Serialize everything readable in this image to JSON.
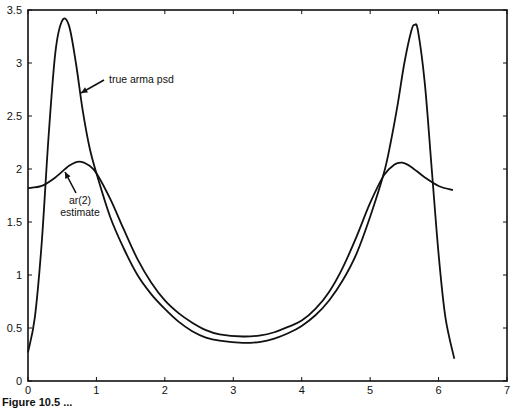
{
  "chart_data": {
    "type": "line",
    "title": "",
    "xlabel": "",
    "ylabel": "",
    "xlim": [
      0,
      7
    ],
    "ylim": [
      0,
      3.5
    ],
    "grid": false,
    "legend": "none (inline annotations with arrows)",
    "x_ticks": [
      "0",
      "1",
      "2",
      "3",
      "4",
      "5",
      "6",
      "7"
    ],
    "y_ticks": [
      "0",
      "0.5",
      "1",
      "1.5",
      "2",
      "2.5",
      "3",
      "3.5"
    ],
    "series": [
      {
        "name": "true arma psd",
        "points": [
          [
            0,
            0.27
          ],
          [
            0.1,
            0.6
          ],
          [
            0.2,
            1.3
          ],
          [
            0.3,
            2.3
          ],
          [
            0.4,
            3.1
          ],
          [
            0.5,
            3.4
          ],
          [
            0.6,
            3.35
          ],
          [
            0.7,
            3.0
          ],
          [
            0.8,
            2.55
          ],
          [
            0.9,
            2.2
          ],
          [
            1.0,
            1.96
          ],
          [
            1.2,
            1.55
          ],
          [
            1.4,
            1.25
          ],
          [
            1.6,
            1.0
          ],
          [
            1.8,
            0.82
          ],
          [
            2.0,
            0.68
          ],
          [
            2.2,
            0.56
          ],
          [
            2.4,
            0.47
          ],
          [
            2.6,
            0.41
          ],
          [
            2.8,
            0.38
          ],
          [
            3.14,
            0.36
          ],
          [
            3.4,
            0.37
          ],
          [
            3.6,
            0.4
          ],
          [
            3.8,
            0.45
          ],
          [
            4.0,
            0.52
          ],
          [
            4.2,
            0.62
          ],
          [
            4.4,
            0.76
          ],
          [
            4.6,
            0.95
          ],
          [
            4.8,
            1.2
          ],
          [
            5.0,
            1.55
          ],
          [
            5.2,
            1.96
          ],
          [
            5.3,
            2.25
          ],
          [
            5.4,
            2.6
          ],
          [
            5.5,
            3.0
          ],
          [
            5.6,
            3.3
          ],
          [
            5.65,
            3.36
          ],
          [
            5.7,
            3.3
          ],
          [
            5.8,
            2.8
          ],
          [
            5.9,
            2.0
          ],
          [
            6.0,
            1.2
          ],
          [
            6.1,
            0.6
          ],
          [
            6.23,
            0.21
          ]
        ]
      },
      {
        "name": "ar(2) estimate",
        "points": [
          [
            0,
            1.82
          ],
          [
            0.2,
            1.84
          ],
          [
            0.4,
            1.92
          ],
          [
            0.6,
            2.03
          ],
          [
            0.75,
            2.07
          ],
          [
            0.9,
            2.03
          ],
          [
            1.0,
            1.96
          ],
          [
            1.2,
            1.72
          ],
          [
            1.4,
            1.43
          ],
          [
            1.6,
            1.15
          ],
          [
            1.8,
            0.93
          ],
          [
            2.0,
            0.76
          ],
          [
            2.2,
            0.64
          ],
          [
            2.4,
            0.55
          ],
          [
            2.6,
            0.48
          ],
          [
            2.8,
            0.44
          ],
          [
            3.14,
            0.42
          ],
          [
            3.4,
            0.43
          ],
          [
            3.6,
            0.46
          ],
          [
            3.8,
            0.51
          ],
          [
            4.0,
            0.57
          ],
          [
            4.2,
            0.68
          ],
          [
            4.4,
            0.84
          ],
          [
            4.6,
            1.07
          ],
          [
            4.8,
            1.36
          ],
          [
            5.0,
            1.68
          ],
          [
            5.2,
            1.94
          ],
          [
            5.35,
            2.04
          ],
          [
            5.47,
            2.06
          ],
          [
            5.6,
            2.02
          ],
          [
            5.8,
            1.92
          ],
          [
            6.0,
            1.84
          ],
          [
            6.21,
            1.8
          ]
        ]
      }
    ],
    "annotations": [
      {
        "text": "true arma psd",
        "label_x": 109,
        "label_y": 83,
        "arrow_from": [
          104,
          80
        ],
        "arrow_to": [
          81,
          93
        ]
      },
      {
        "text_lines": [
          "ar(2)",
          "estimate"
        ],
        "label_x": 80,
        "label_y": 204,
        "arrow_from": [
          76,
          193
        ],
        "arrow_to": [
          65,
          172
        ]
      }
    ],
    "caption": "Figure 10.5  ..."
  },
  "plot": {
    "left": 28,
    "right": 507,
    "top": 10,
    "bottom": 381,
    "line_color": "#111111"
  }
}
